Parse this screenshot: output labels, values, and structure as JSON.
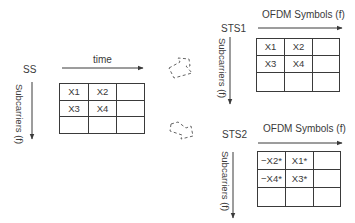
{
  "source": {
    "label": "SS",
    "horizontal_axis_label": "time",
    "vertical_axis_label": "Subcarriers (f)",
    "grid": [
      [
        "X1",
        "X2",
        ""
      ],
      [
        "X3",
        "X4",
        ""
      ],
      [
        "",
        "",
        ""
      ]
    ]
  },
  "sts1": {
    "label": "STS1",
    "horizontal_axis_label": "OFDM Symbols (f)",
    "vertical_axis_label": "Subcarriers (f)",
    "grid": [
      [
        "X1",
        "X2",
        ""
      ],
      [
        "X3",
        "X4",
        ""
      ],
      [
        "",
        "",
        ""
      ]
    ]
  },
  "sts2": {
    "label": "STS2",
    "horizontal_axis_label": "OFDM Symbols (f)",
    "vertical_axis_label": "Subcarriers (f)",
    "grid": [
      [
        "−X2*",
        "X1*",
        ""
      ],
      [
        "−X4*",
        "X3*",
        ""
      ],
      [
        "",
        "",
        ""
      ]
    ]
  },
  "colors": {
    "line": "#3a3a3a",
    "dashed_arrow": "#555555",
    "background": "#ffffff"
  }
}
